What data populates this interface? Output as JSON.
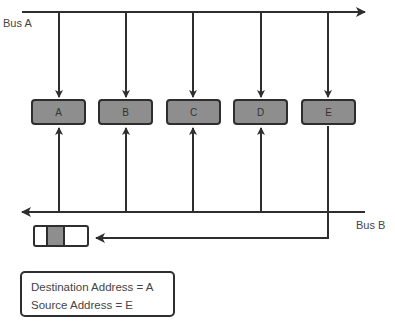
{
  "diagram": {
    "title": "",
    "bus_a": {
      "label": "Bus A",
      "direction": "right"
    },
    "bus_b": {
      "label": "Bus B",
      "direction": "left"
    },
    "nodes": [
      {
        "id": "A",
        "label": "A"
      },
      {
        "id": "B",
        "label": "B"
      },
      {
        "id": "C",
        "label": "C"
      },
      {
        "id": "D",
        "label": "D"
      },
      {
        "id": "E",
        "label": "E"
      }
    ],
    "sender": "E",
    "packet": {
      "segments": [
        "",
        "",
        ""
      ],
      "highlighted_segment": 1
    },
    "address_box": {
      "line1": "Destination Address = A",
      "line2": "Source Address = E"
    },
    "colors": {
      "node_fill": "#8e8e8e",
      "stroke": "#2e2e2e"
    }
  }
}
